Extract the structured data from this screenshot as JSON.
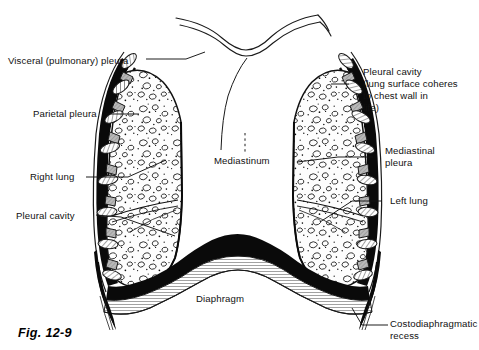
{
  "figure": {
    "caption": "Fig. 12-9",
    "background_color": "#ffffff",
    "ink_color": "#111111"
  },
  "labels": {
    "visceral_pleura": "Visceral (pulmonary) pleura",
    "parietal_pleura": "Parietal pleura",
    "right_lung": "Right lung",
    "pleural_cavity_left": "Pleural cavity",
    "pleural_cavity_right_l1": "Pleural cavity",
    "pleural_cavity_right_l2": "(lung surface coheres",
    "pleural_cavity_right_l3": "to chest wall in",
    "pleural_cavity_right_l4": "life)",
    "mediastinal_pleura_l1": "Mediastinal",
    "mediastinal_pleura_l2": "pleura",
    "left_lung": "Left lung",
    "mediastinum": "Mediastinum",
    "diaphragm": "Diaphragm",
    "costodiaphragmatic_l1": "Costodiaphragmatic",
    "costodiaphragmatic_l2": "recess"
  },
  "structures": [
    {
      "name": "rib-cage",
      "side": "both",
      "description": "oval rib cross-sections with intercostal muscle blocks"
    },
    {
      "name": "parietal-pleura",
      "description": "thick black line lining inner chest wall"
    },
    {
      "name": "visceral-pleura",
      "description": "thick black line on lung surface"
    },
    {
      "name": "pleural-cavity",
      "description": "potential space between parietal and visceral pleura"
    },
    {
      "name": "right-lung",
      "description": "stippled parenchyma, viewer left"
    },
    {
      "name": "left-lung",
      "description": "stippled parenchyma, viewer right"
    },
    {
      "name": "mediastinum",
      "description": "central space between the two lungs"
    },
    {
      "name": "diaphragm",
      "description": "broad muscular arch at base of thorax"
    },
    {
      "name": "costodiaphragmatic-recess",
      "description": "pointed lateral gutter where costal and diaphragmatic pleura meet"
    },
    {
      "name": "clavicle-neck-outline",
      "description": "thin curved lines at superior thoracic aperture"
    }
  ]
}
